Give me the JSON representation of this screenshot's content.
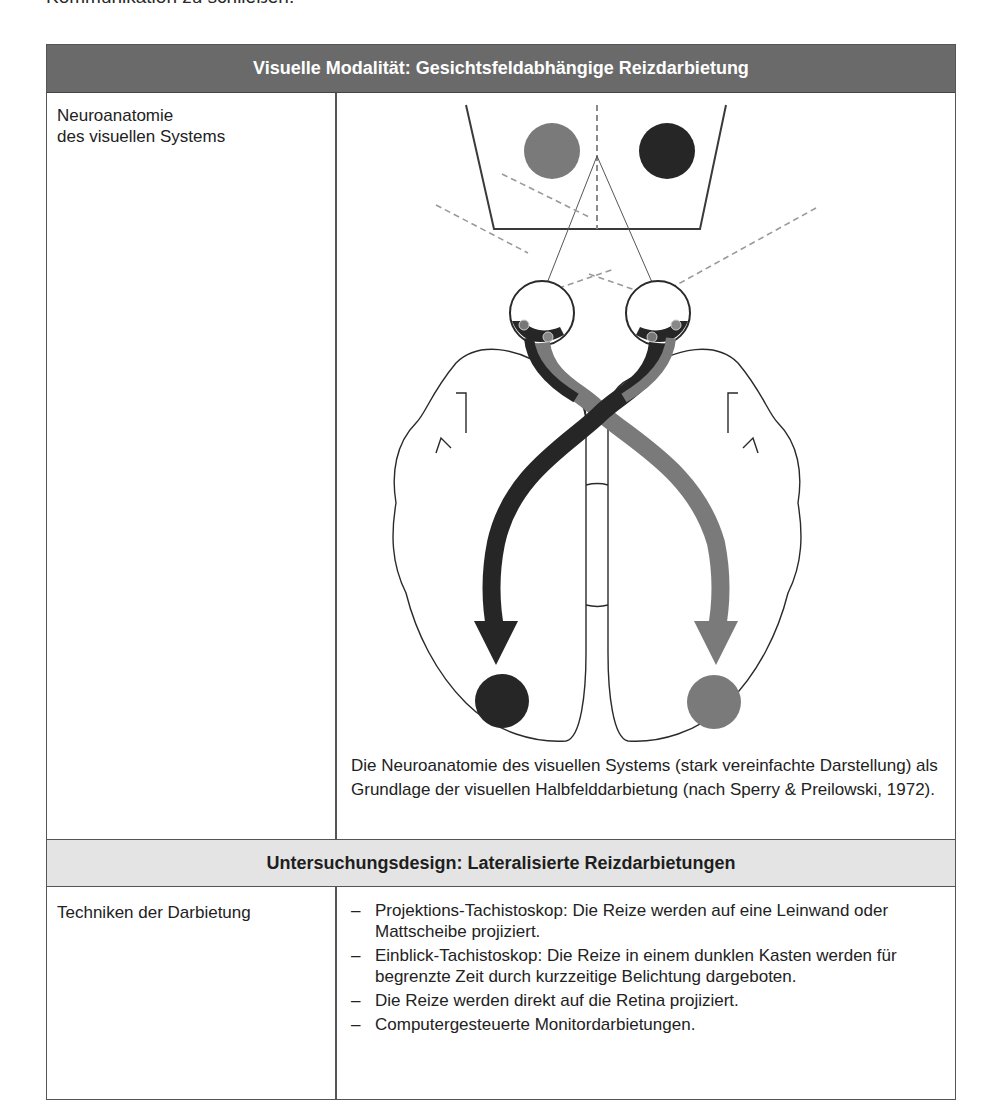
{
  "intro_text": "Kommunikation zu schließen.",
  "table": {
    "section1": {
      "header": "Visuelle Modalität: Gesichtsfeldabhängige Reizdarbietung",
      "row_label_line1": "Neuroanatomie",
      "row_label_line2": "des visuellen Systems",
      "figure": {
        "description": "Schematic top view of brain: two eyes viewing a screen with a gray circle (left) and black circle (right); optic pathways cross at the chiasm and project as arrows to the opposite hemispheres ending in black (left) and gray (right) circles.",
        "colors": {
          "left_stimulus": "#7a7a7a",
          "right_stimulus": "#262626",
          "line": "#2a2a2a",
          "dashed": "#9a9a9a"
        }
      },
      "caption": "Die Neuroanatomie des visuellen Systems (stark vereinfachte Darstellung) als Grundlage der visuellen Halbfelddarbietung (nach Sperry & Preilowski, 1972)."
    },
    "section2": {
      "header": "Untersuchungsdesign: Lateralisierte Reizdarbietungen",
      "row_label": "Techniken der Darbietung",
      "items": [
        "Projektions-Tachistoskop: Die Reize werden auf eine Lein­wand oder Mattscheibe projiziert.",
        "Einblick-Tachistoskop: Die Reize in einem dunklen Kasten werden für begrenzte Zeit durch kurzzeitige Belichtung darge­boten.",
        "Die Reize werden direkt auf die Retina projiziert.",
        "Computergesteuerte Monitordarbietungen."
      ],
      "bullet": "–"
    },
    "colors": {
      "header_dark": "#6a6a6a",
      "header_light": "#e4e4e4",
      "border": "#555555"
    }
  }
}
